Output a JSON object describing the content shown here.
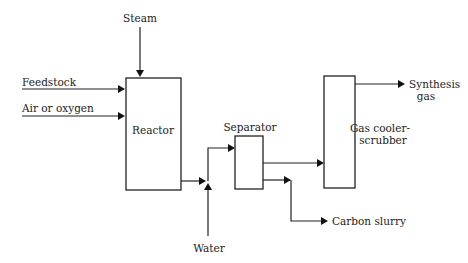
{
  "diagram": {
    "type": "process-flow",
    "units": {
      "reactor": "Reactor",
      "separator": "Separator",
      "scrubber_line1": "Gas cooler-",
      "scrubber_line2": "scrubber"
    },
    "streams": {
      "steam": "Steam",
      "feedstock": "Feedstock",
      "air": "Air or oxygen",
      "water": "Water",
      "carbon_slurry": "Carbon slurry",
      "syngas_line1": "Synthesis",
      "syngas_line2": "gas"
    }
  }
}
